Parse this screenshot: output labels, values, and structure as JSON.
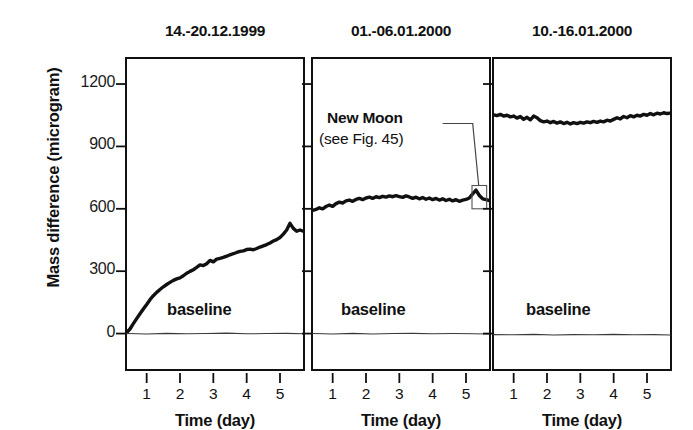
{
  "figure": {
    "ylabel": "Mass difference (microgram)",
    "xlabel": "Time (day)",
    "baseline_label": "baseline",
    "yticks": [
      0,
      300,
      600,
      900,
      1200
    ],
    "ytick_labels": [
      "0",
      "300",
      "600",
      "900",
      "1200"
    ],
    "xticks": [
      1,
      2,
      3,
      4,
      5
    ],
    "xtick_labels": [
      "1",
      "2",
      "3",
      "4",
      "5"
    ],
    "ylim": [
      -180,
      1330
    ],
    "xlim": [
      0.35,
      5.75
    ],
    "line_color": "#111111",
    "baseline_color": "#3a3a3a",
    "axis_color": "#111111"
  },
  "annotation": {
    "line1": "New Moon",
    "line2": "(see Fig. 45)",
    "panel": 2
  },
  "chart_data": {
    "type": "line",
    "title": "",
    "xlabel": "Time (day)",
    "ylabel": "Mass difference (microgram)",
    "xlim": [
      0.35,
      5.75
    ],
    "ylim": [
      -180,
      1330
    ],
    "grid": false,
    "legend": "none",
    "panels": [
      {
        "title": "14.-20.12.1999",
        "series": [
          {
            "name": "mass difference",
            "x": [
              0.4,
              0.5,
              0.6,
              0.7,
              0.8,
              0.9,
              1.0,
              1.1,
              1.2,
              1.3,
              1.4,
              1.5,
              1.6,
              1.7,
              1.8,
              1.9,
              2.0,
              2.1,
              2.2,
              2.3,
              2.4,
              2.5,
              2.6,
              2.7,
              2.8,
              2.9,
              3.0,
              3.1,
              3.2,
              3.3,
              3.4,
              3.5,
              3.6,
              3.7,
              3.8,
              3.9,
              4.0,
              4.1,
              4.2,
              4.3,
              4.4,
              4.5,
              4.6,
              4.7,
              4.8,
              4.9,
              5.0,
              5.1,
              5.2,
              5.3,
              5.4,
              5.5,
              5.6,
              5.7
            ],
            "y": [
              5,
              22,
              48,
              72,
              95,
              118,
              140,
              163,
              182,
              198,
              212,
              225,
              236,
              246,
              256,
              263,
              268,
              278,
              290,
              299,
              307,
              318,
              330,
              327,
              336,
              352,
              345,
              358,
              362,
              366,
              372,
              379,
              384,
              390,
              395,
              398,
              404,
              406,
              403,
              409,
              416,
              422,
              428,
              436,
              445,
              452,
              462,
              478,
              498,
              530,
              506,
              492,
              498,
              492
            ]
          },
          {
            "name": "baseline",
            "x": [
              0.4,
              1.0,
              1.6,
              2.2,
              2.8,
              3.4,
              4.0,
              4.6,
              5.2,
              5.7
            ],
            "y": [
              0,
              -2,
              1,
              -1,
              0,
              2,
              -1,
              0,
              1,
              -1
            ]
          }
        ]
      },
      {
        "title": "01.-06.01.2000",
        "series": [
          {
            "name": "mass difference",
            "x": [
              0.4,
              0.5,
              0.6,
              0.7,
              0.8,
              0.9,
              1.0,
              1.1,
              1.2,
              1.3,
              1.4,
              1.5,
              1.6,
              1.7,
              1.8,
              1.9,
              2.0,
              2.1,
              2.2,
              2.3,
              2.4,
              2.5,
              2.6,
              2.7,
              2.8,
              2.9,
              3.0,
              3.1,
              3.2,
              3.3,
              3.4,
              3.5,
              3.6,
              3.7,
              3.8,
              3.9,
              4.0,
              4.1,
              4.2,
              4.3,
              4.4,
              4.5,
              4.6,
              4.7,
              4.8,
              4.9,
              5.0,
              5.1,
              5.2,
              5.3,
              5.4,
              5.5,
              5.6,
              5.7
            ],
            "y": [
              592,
              597,
              605,
              600,
              611,
              618,
              612,
              625,
              632,
              628,
              638,
              642,
              636,
              645,
              650,
              644,
              652,
              656,
              650,
              658,
              654,
              660,
              656,
              662,
              658,
              663,
              659,
              655,
              662,
              657,
              650,
              656,
              648,
              654,
              646,
              652,
              644,
              650,
              642,
              648,
              640,
              646,
              638,
              644,
              636,
              642,
              645,
              652,
              672,
              690,
              664,
              648,
              644,
              640
            ]
          },
          {
            "name": "baseline",
            "x": [
              0.4,
              1.0,
              1.6,
              2.2,
              2.8,
              3.4,
              4.0,
              4.6,
              5.2,
              5.7
            ],
            "y": [
              0,
              -2,
              1,
              -2,
              0,
              1,
              -1,
              0,
              -1,
              -2
            ]
          }
        ]
      },
      {
        "title": "10.-16.01.2000",
        "series": [
          {
            "name": "mass difference",
            "x": [
              0.4,
              0.5,
              0.6,
              0.7,
              0.8,
              0.9,
              1.0,
              1.1,
              1.2,
              1.3,
              1.4,
              1.5,
              1.6,
              1.7,
              1.8,
              1.9,
              2.0,
              2.1,
              2.2,
              2.3,
              2.4,
              2.5,
              2.6,
              2.7,
              2.8,
              2.9,
              3.0,
              3.1,
              3.2,
              3.3,
              3.4,
              3.5,
              3.6,
              3.7,
              3.8,
              3.9,
              4.0,
              4.1,
              4.2,
              4.3,
              4.4,
              4.5,
              4.6,
              4.7,
              4.8,
              4.9,
              5.0,
              5.1,
              5.2,
              5.3,
              5.4,
              5.5,
              5.6,
              5.7
            ],
            "y": [
              1052,
              1048,
              1054,
              1046,
              1050,
              1042,
              1046,
              1036,
              1044,
              1030,
              1040,
              1028,
              1046,
              1038,
              1024,
              1018,
              1022,
              1014,
              1020,
              1012,
              1018,
              1010,
              1016,
              1008,
              1014,
              1010,
              1016,
              1012,
              1018,
              1014,
              1020,
              1016,
              1022,
              1018,
              1026,
              1022,
              1030,
              1038,
              1032,
              1044,
              1038,
              1048,
              1042,
              1050,
              1046,
              1054,
              1050,
              1058,
              1052,
              1060,
              1056,
              1062,
              1058,
              1060
            ]
          },
          {
            "name": "baseline",
            "x": [
              0.4,
              1.0,
              1.6,
              2.2,
              2.8,
              3.4,
              4.0,
              4.6,
              5.2,
              5.7
            ],
            "y": [
              -5,
              -6,
              -4,
              -7,
              -5,
              -6,
              -4,
              -6,
              -5,
              -7
            ]
          }
        ]
      }
    ]
  }
}
